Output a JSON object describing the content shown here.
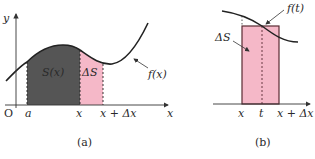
{
  "figure_a": {
    "caption": "(a)",
    "axis_y_label": "y",
    "axis_x_label": "x",
    "origin_label": "O",
    "tick_a": "a",
    "tick_x": "x",
    "tick_x_dx": "x + Δx",
    "region_s_label": "S(x)",
    "region_ds_label": "ΔS",
    "curve_label": "f(x)",
    "colors": {
      "dark_region": "#555555",
      "pink_region": "#f5b8c8",
      "curve": "#222222"
    }
  },
  "figure_b": {
    "caption": "(b)",
    "tick_x": "x",
    "tick_t": "t",
    "tick_x_dx": "x + Δx",
    "region_ds_label": "ΔS",
    "curve_label": "f(t)",
    "colors": {
      "rect_fill": "#f5b8c8",
      "rect_stroke": "#5a2a33",
      "curve": "#222222"
    }
  }
}
